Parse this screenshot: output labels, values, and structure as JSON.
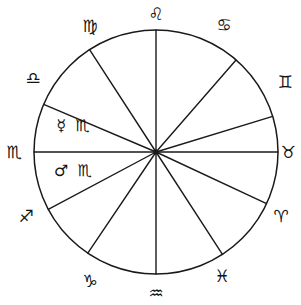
{
  "figure": {
    "background_color": "#ffffff",
    "ink_color": "#1a1a1a"
  },
  "wheel": {
    "center_x": 156,
    "center_y": 152,
    "radius": 122,
    "sector_count": 12
  },
  "chart_data": {
    "type": "pie",
    "xlabel": "",
    "ylabel": "",
    "legend_position": "outside-ring",
    "grid": false,
    "categories": [
      "Leo",
      "Cancer",
      "Gemini",
      "Taurus",
      "Aries",
      "Pisces",
      "Aquarius",
      "Capricorn",
      "Sagittarius",
      "Scorpio (upper)",
      "Libra",
      "Virgo"
    ],
    "values": [
      30,
      30,
      30,
      30,
      30,
      30,
      30,
      30,
      30,
      30,
      30,
      30
    ],
    "spoke_angles_deg": [
      270,
      311,
      343,
      360,
      25,
      57,
      90,
      124,
      152,
      180,
      203,
      237
    ],
    "annotations": [
      "Mercury in Scorpio",
      "Mars in Scorpio"
    ]
  },
  "signs": [
    {
      "name": "Leo",
      "glyph": "♌",
      "x": 156,
      "y": 14,
      "angle_deg": 270
    },
    {
      "name": "Cancer",
      "glyph": "♋",
      "x": 224,
      "y": 25,
      "angle_deg": 311
    },
    {
      "name": "Gemini",
      "glyph": "♊",
      "x": 285,
      "y": 82,
      "angle_deg": 343
    },
    {
      "name": "Taurus",
      "glyph": "♉",
      "x": 288,
      "y": 152,
      "angle_deg": 360
    },
    {
      "name": "Aries",
      "glyph": "♈",
      "x": 281,
      "y": 216,
      "angle_deg": 25
    },
    {
      "name": "Pisces",
      "glyph": "♓",
      "x": 222,
      "y": 276,
      "angle_deg": 57
    },
    {
      "name": "Aquarius",
      "glyph": "♒",
      "x": 156,
      "y": 293,
      "angle_deg": 90
    },
    {
      "name": "Capricorn",
      "glyph": "♑",
      "x": 90,
      "y": 281,
      "angle_deg": 124
    },
    {
      "name": "Sagittarius",
      "glyph": "♐",
      "x": 26,
      "y": 216,
      "angle_deg": 152
    },
    {
      "name": "Scorpio",
      "glyph": "♏",
      "x": 14,
      "y": 152,
      "angle_deg": 180
    },
    {
      "name": "Libra",
      "glyph": "♎",
      "x": 33,
      "y": 78,
      "angle_deg": 203
    },
    {
      "name": "Virgo",
      "glyph": "♍",
      "x": 90,
      "y": 26,
      "angle_deg": 237
    }
  ],
  "inner_labels": [
    {
      "name": "mercury-in-scorpio",
      "text": "☿ ♏",
      "planet": "Mercury",
      "sign": "Scorpio",
      "x": 74,
      "y": 126
    },
    {
      "name": "mars-in-scorpio",
      "text": "♂ ♏",
      "planet": "Mars",
      "sign": "Scorpio",
      "x": 74,
      "y": 171
    }
  ]
}
